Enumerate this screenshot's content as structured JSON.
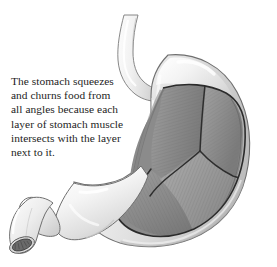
{
  "figure": {
    "background_color": "#ffffff",
    "caption_text": "The stomach squeezes\nand churns food from\nall angles because each\nlayer of stomach muscle\nintersects with the layer\nnext to it.",
    "caption_lines": [
      "The stomach squeezes",
      "and churns food from",
      "all angles because each",
      "layer of stomach muscle",
      "intersects with the layer",
      "next to it."
    ],
    "caption_color": "#1d1d1d"
  },
  "anatomy": {
    "parts": [
      {
        "name": "esophagus",
        "label": "Esophagus",
        "fill": "#ececec"
      },
      {
        "name": "fundus",
        "label": "Fundus",
        "fill": "#e4e4e4"
      },
      {
        "name": "body",
        "label": "Body",
        "fill": "#e8e8e8"
      },
      {
        "name": "antrum",
        "label": "Antrum",
        "fill": "#ededed"
      },
      {
        "name": "pylorus",
        "label": "Pylorus",
        "fill": "#e9e9e9"
      },
      {
        "name": "duodenum",
        "label": "Duodenum",
        "fill": "#ebebeb"
      },
      {
        "name": "duodenum-cut-lumen",
        "label": "Cut lumen",
        "fill": "#6b6b6b"
      },
      {
        "name": "longitudinal-muscle",
        "label": "Longitudinal muscle layer",
        "fill": "#9b9b9b"
      },
      {
        "name": "circular-muscle",
        "label": "Circular muscle layer",
        "fill": "#8d8d8d"
      },
      {
        "name": "oblique-muscle",
        "label": "Oblique muscle layer",
        "fill": "#858585"
      }
    ]
  },
  "colors": {
    "serosa_light": "#f4f4f4",
    "serosa_mid": "#e2e2e2",
    "serosa_shadow": "#c5c5c5",
    "outline": "#6f6f6f",
    "muscle_dark": "#7d7d7d",
    "muscle_mid": "#8d8d8d",
    "muscle_light": "#a6a6a6",
    "cut_edge": "#3a3a3a"
  }
}
